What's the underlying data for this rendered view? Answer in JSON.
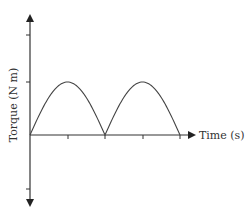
{
  "chart_data": {
    "type": "line",
    "title": "",
    "xlabel": "Time (s)",
    "ylabel": "Torque (N m)",
    "x": [
      0,
      1,
      2,
      3,
      4
    ],
    "series": [
      {
        "name": "Torque",
        "shape": "abs(sin)",
        "values": [
          0,
          1,
          0,
          1,
          0
        ]
      }
    ],
    "xticks": 5,
    "yticks_above": 2,
    "yticks_below": 1,
    "grid": false,
    "legend": null,
    "colors": {
      "axis": "#333333",
      "curve": "#444444"
    }
  },
  "labels": {
    "x_axis": "Time (s)",
    "y_axis": "Torque (N m)"
  }
}
